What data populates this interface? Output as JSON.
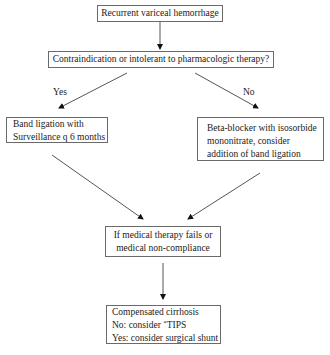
{
  "diagram": {
    "type": "flowchart",
    "colors": {
      "line": "#555555",
      "border": "#6a6a6a",
      "text": "#222222",
      "background": "#ffffff"
    },
    "nodes": {
      "start": {
        "lines": [
          "Recurrent variceal hemorrhage"
        ]
      },
      "question": {
        "lines": [
          "Contraindication or intolerant to pharmacologic therapy?"
        ]
      },
      "band_ligation": {
        "lines": [
          "Band ligation with",
          "Surveillance q 6 months"
        ]
      },
      "beta_blocker": {
        "lines": [
          "Beta-blocker with isosorbide",
          "mononitrate, consider",
          "addition of band ligation"
        ]
      },
      "therapy_fails": {
        "lines": [
          "If medical therapy fails or",
          "medical non-compliance"
        ]
      },
      "cirrhosis": {
        "line1": "Compensated cirrhosis",
        "line2_prefix": "No: consider ",
        "line2_mark": "*",
        "line2_suffix": "TIPS",
        "line3": "Yes: consider surgical shunt"
      }
    },
    "edge_labels": {
      "yes": "Yes",
      "no": "No"
    },
    "edges": [
      {
        "from": "start",
        "to": "question"
      },
      {
        "from": "question",
        "to": "band_ligation",
        "label": "Yes"
      },
      {
        "from": "question",
        "to": "beta_blocker",
        "label": "No"
      },
      {
        "from": "band_ligation",
        "to": "therapy_fails"
      },
      {
        "from": "beta_blocker",
        "to": "therapy_fails"
      },
      {
        "from": "therapy_fails",
        "to": "cirrhosis"
      }
    ]
  }
}
